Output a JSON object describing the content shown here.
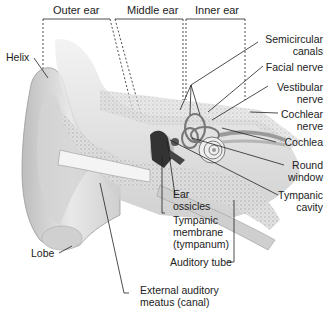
{
  "diagram": {
    "regions": [
      {
        "label": "Outer ear"
      },
      {
        "label": "Middle ear"
      },
      {
        "label": "Inner ear"
      }
    ],
    "labels": {
      "helix": "Helix",
      "lobe": "Lobe",
      "semicircular_canals": [
        "Semicircular",
        "canals"
      ],
      "facial_nerve": "Facial nerve",
      "vestibular_nerve": [
        "Vestibular",
        "nerve"
      ],
      "cochlear_nerve": [
        "Cochlear",
        "nerve"
      ],
      "cochlea": "Cochlea",
      "round_window": [
        "Round",
        "window"
      ],
      "tympanic_cavity": [
        "Tympanic",
        "cavity"
      ],
      "ear_ossicles": [
        "Ear",
        "ossicles"
      ],
      "tympanic_membrane": [
        "Tympanic",
        "membrane",
        "(tympanum)"
      ],
      "auditory_tube": "Auditory tube",
      "external_auditory_meatus": [
        "External auditory",
        "meatus (canal)"
      ]
    },
    "colors": {
      "line": "#222222",
      "tissue_light": "#e6e6e6",
      "tissue_mid": "#c4c4c4",
      "tissue_dark": "#8a8a8a",
      "ossicle": "#333333"
    }
  }
}
